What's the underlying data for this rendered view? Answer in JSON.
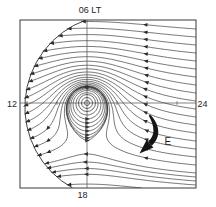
{
  "figure": {
    "top_label": "06 LT",
    "left_label": "12",
    "right_label": "24",
    "bottom_label": "18",
    "field_arrow_label": "E"
  },
  "colors": {
    "background": "#ffffff",
    "stream_line": "#2b2b2b",
    "frame": "#3a3a3a",
    "axis": "#4a4a4a",
    "field_arrow": "#151515",
    "label_text": "#1e1e1e"
  }
}
